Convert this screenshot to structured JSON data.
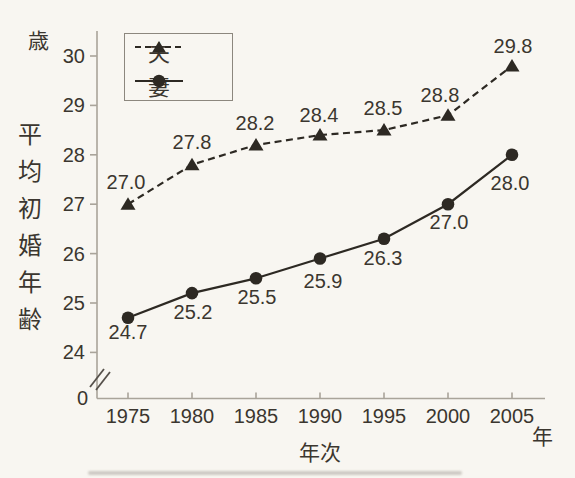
{
  "page": {
    "background_color": "#f8f6f1",
    "ink_color": "#2d2923",
    "axis_color": "#a9a49a",
    "text_color": "#3b362f"
  },
  "chart_data": {
    "type": "line",
    "title": "",
    "xlabel": "年次",
    "x_unit_label": "年",
    "ylabel": "平均初婚年齢",
    "y_unit_label": "歳",
    "x": [
      1975,
      1980,
      1985,
      1990,
      1995,
      2000,
      2005
    ],
    "x_tick_labels": [
      "1975",
      "1980",
      "1985",
      "1990",
      "1995",
      "2000",
      "2005"
    ],
    "y_ticks": [
      24,
      25,
      26,
      27,
      28,
      29,
      30
    ],
    "y_origin_label": "0",
    "y_axis_break": true,
    "ylim_displayed": [
      24,
      30
    ],
    "grid": false,
    "legend_position": "top-left-inside",
    "series": [
      {
        "name": "夫",
        "line_style": "dashed",
        "marker": "triangle",
        "label_position": "above",
        "values": [
          27.0,
          27.8,
          28.2,
          28.4,
          28.5,
          28.8,
          29.8
        ],
        "value_labels": [
          "27.0",
          "27.8",
          "28.2",
          "28.4",
          "28.5",
          "28.8",
          "29.8"
        ]
      },
      {
        "name": "妻",
        "line_style": "solid",
        "marker": "circle",
        "label_position": "below",
        "values": [
          24.7,
          25.2,
          25.5,
          25.9,
          26.3,
          27.0,
          28.0
        ],
        "value_labels": [
          "24.7",
          "25.2",
          "25.5",
          "25.9",
          "26.3",
          "27.0",
          "28.0"
        ]
      }
    ]
  }
}
